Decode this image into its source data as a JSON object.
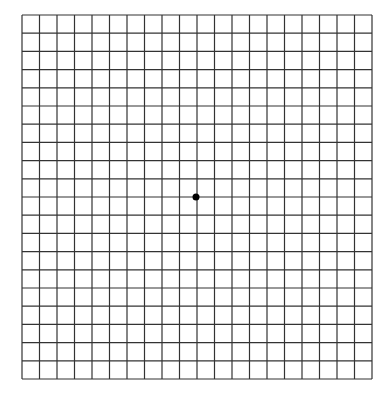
{
  "grid": {
    "type": "amsler-grid",
    "columns": 20,
    "rows": 20,
    "left": 22,
    "top": 15,
    "right": 372,
    "bottom": 379,
    "line_color": "#333333",
    "background": "#ffffff",
    "center_dot": {
      "x": 196,
      "y": 197,
      "radius": 3.5,
      "color": "#000000"
    }
  }
}
